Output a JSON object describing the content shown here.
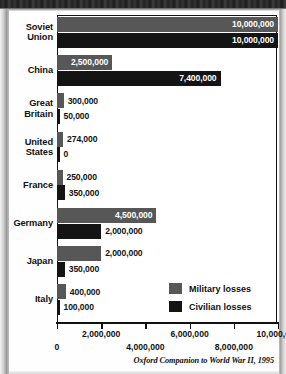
{
  "source_note": "Oxford Companion to World War II, 1995",
  "legend": {
    "items": [
      {
        "label": "Military losses",
        "color": "#575757",
        "key": "military"
      },
      {
        "label": "Civilian losses",
        "color": "#141414",
        "key": "civilian"
      }
    ]
  },
  "axis": {
    "ticks": [
      {
        "value": 0,
        "label": "0",
        "row": 2
      },
      {
        "value": 2000000,
        "label": "2,000,000",
        "row": 1
      },
      {
        "value": 4000000,
        "label": "4,000,000",
        "row": 2
      },
      {
        "value": 6000000,
        "label": "6,000,000",
        "row": 1
      },
      {
        "value": 8000000,
        "label": "8,000,000",
        "row": 2
      },
      {
        "value": 10000000,
        "label": "10,000,000",
        "row": 1
      }
    ]
  },
  "chart_data": {
    "type": "bar",
    "orientation": "horizontal",
    "title": "",
    "xlabel": "",
    "ylabel": "",
    "xlim": [
      0,
      10000000
    ],
    "grid": false,
    "legend_position": "inside-bottom-right",
    "categories": [
      "Soviet Union",
      "China",
      "Great Britain",
      "United States",
      "France",
      "Germany",
      "Japan",
      "Italy"
    ],
    "series": [
      {
        "name": "Military losses",
        "color": "#575757",
        "values": [
          10000000,
          2500000,
          300000,
          274000,
          250000,
          4500000,
          2000000,
          400000
        ],
        "labels": [
          "10,000,000",
          "2,500,000",
          "300,000",
          "274,000",
          "250,000",
          "4,500,000",
          "2,000,000",
          "400,000"
        ]
      },
      {
        "name": "Civilian losses",
        "color": "#141414",
        "values": [
          10000000,
          7400000,
          50000,
          0,
          350000,
          2000000,
          350000,
          100000
        ],
        "labels": [
          "10,000,000",
          "7,400,000",
          "50,000",
          "0",
          "350,000",
          "2,000,000",
          "350,000",
          "100,000"
        ]
      }
    ],
    "source": "Oxford Companion to World War II, 1995"
  }
}
